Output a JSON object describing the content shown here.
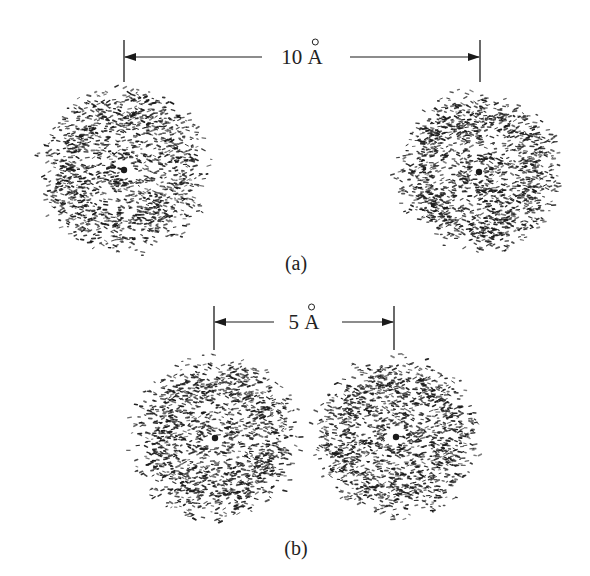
{
  "figure": {
    "panels": [
      {
        "id": "a",
        "label": "(a)",
        "distance": {
          "value": "10",
          "unit": "Å",
          "text": "10 Å"
        },
        "bar": {
          "x1": 124,
          "x2": 480,
          "y": 57,
          "tick_top": 40,
          "tick_bottom": 82
        },
        "label_pos": {
          "x": 296,
          "y": 263
        },
        "atoms": [
          {
            "name": "left-atom",
            "cx": 124,
            "cy": 170,
            "r": 90
          },
          {
            "name": "right-atom",
            "cx": 479,
            "cy": 172,
            "r": 88
          }
        ]
      },
      {
        "id": "b",
        "label": "(b)",
        "distance": {
          "value": "5",
          "unit": "Å",
          "text": "5 Å"
        },
        "bar": {
          "x1": 214,
          "x2": 394,
          "y": 322,
          "tick_top": 306,
          "tick_bottom": 350
        },
        "label_pos": {
          "x": 296,
          "y": 548
        },
        "atoms": [
          {
            "name": "left-atom",
            "cx": 215,
            "cy": 438,
            "r": 90
          },
          {
            "name": "right-atom",
            "cx": 396,
            "cy": 437,
            "r": 88
          }
        ]
      }
    ],
    "style": {
      "ink_color": "#1a1a1a",
      "background": "#ffffff",
      "inner_ring_radius": 15,
      "outer_ring_radius": 55
    }
  }
}
